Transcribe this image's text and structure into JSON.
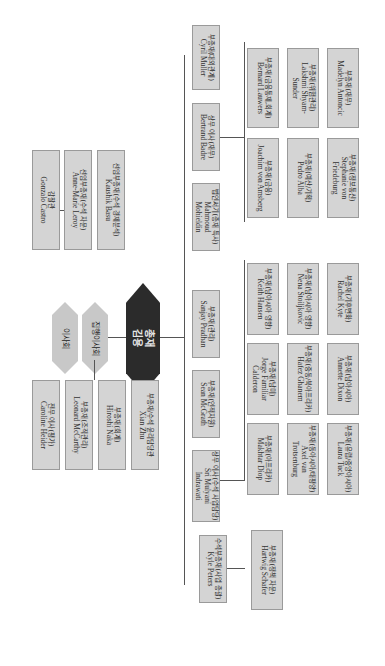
{
  "governance": {
    "board": "이사회",
    "executive_board": "집행이사회",
    "president": {
      "role": "총재",
      "name": "김용"
    }
  },
  "president_office": [
    {
      "role": "감찰관",
      "name": "Gonzalo Castro"
    },
    {
      "role": "선임부총재(수석 자문)",
      "name": "Anne-Marie Leroy"
    },
    {
      "role": "선임부총재(수석 경제분석)",
      "name": "Kaushik Basu"
    }
  ],
  "executive_board_staff": [
    {
      "role": "전무 이사(평가)",
      "name": "Caroline Heider"
    }
  ],
  "president_direct": [
    {
      "role": "부총재(조직관리)",
      "name": "Leonard McCarthy"
    },
    {
      "role": "부총재(회계)",
      "name": "Hiroshi Naka"
    },
    {
      "role": "부총재/수석 윤리담당관",
      "name": "Xian Zhu"
    }
  ],
  "top_row": [
    {
      "role": "부총재(대외관계)",
      "name": "Cyril Muller"
    },
    {
      "role": "상무 이사(재무)",
      "name": "Bertrand Badre"
    },
    {
      "role": "법인서기(총재 특사)",
      "name": "Mahmoud Mohieldin"
    },
    {
      "role": "부총재(관리)",
      "name": "Sanjay Pradhan"
    },
    {
      "role": "부총재(인적자원)",
      "name": "Sean McGrath"
    },
    {
      "role": "상무 이사(수석 사업담당)",
      "name": "Sri Mulyani Indrawati"
    },
    {
      "role": "수석부총재(사업 총괄)",
      "name": "Kyle Peters"
    }
  ],
  "finance_units": [
    {
      "role": "부총재(금융통제,회계)",
      "name": "Bernard Lauwers"
    },
    {
      "role": "부총재(위험관리)",
      "name": "Lakshmi Shyam-Sunder"
    },
    {
      "role": "부총재(재무)",
      "name": "Madelyn Antoncic"
    },
    {
      "role": "부총재(금융)",
      "name": "Joachim von Amsberg"
    },
    {
      "role": "부총재(예산/기획)",
      "name": "Pedro Alba"
    },
    {
      "role": "부총재(정보통신)",
      "name": "Stephanie von Friedeburg"
    }
  ],
  "regional_units": [
    {
      "role": "부총재(남아시아 영향)",
      "name": "Keith Hansen"
    },
    {
      "role": "부총재(남아시아 영향)",
      "name": "Nena Stoiljkovic"
    },
    {
      "role": "부총재(기후변화)",
      "name": "Rachel Kyte"
    },
    {
      "role": "부총재(남미)",
      "name": "Jorge Familiar Calderon"
    },
    {
      "role": "부총재(중동/북아프리카)",
      "name": "Hafez Ghanem"
    },
    {
      "role": "부총재(남아시아)",
      "name": "Annette Dixon"
    },
    {
      "role": "부총재(아프리카)",
      "name": "Makhtar Diop"
    },
    {
      "role": "부총재(동아시아/태평양)",
      "name": "Axel van Trotsenburg"
    },
    {
      "role": "부총재(유럽/중앙아시아)",
      "name": "Laura Tuck"
    }
  ],
  "ops_units": [
    {
      "role": "부총재(정책 자문)",
      "name": "Hartwig Schafer"
    }
  ]
}
